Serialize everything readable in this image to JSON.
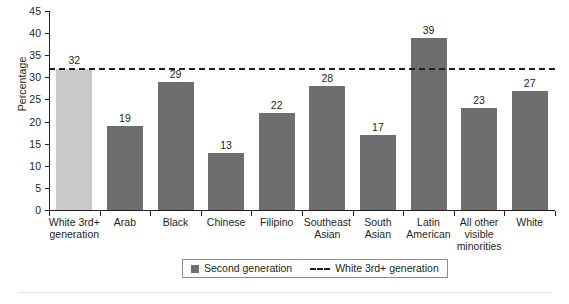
{
  "chart_data": {
    "type": "bar",
    "title": "",
    "xlabel": "",
    "ylabel": "Percentage",
    "ylim": [
      0,
      45
    ],
    "yticks": [
      0,
      5,
      10,
      15,
      20,
      25,
      30,
      35,
      40,
      45
    ],
    "grid": false,
    "legend_position": "bottom",
    "categories": [
      "White 3rd+ generation",
      "Arab",
      "Black",
      "Chinese",
      "Filipino",
      "Southeast Asian",
      "South Asian",
      "Latin American",
      "All other visible minorities",
      "White"
    ],
    "category_lines": [
      [
        "White 3rd+",
        "generation"
      ],
      [
        "Arab"
      ],
      [
        "Black"
      ],
      [
        "Chinese"
      ],
      [
        "Filipino"
      ],
      [
        "Southeast",
        "Asian"
      ],
      [
        "South",
        "Asian"
      ],
      [
        "Latin",
        "American"
      ],
      [
        "All other",
        "visible",
        "minorities"
      ],
      [
        "White"
      ]
    ],
    "series": [
      {
        "name": "Second generation",
        "values": [
          32,
          19,
          29,
          13,
          22,
          28,
          17,
          39,
          23,
          27
        ],
        "bar_styles": [
          "baseline",
          "second",
          "second",
          "second",
          "second",
          "second",
          "second",
          "second",
          "second",
          "second"
        ]
      }
    ],
    "reference_line": {
      "label": "White 3rd+ generation",
      "value": 32,
      "style": "dashed"
    },
    "legend": [
      {
        "label": "Second generation",
        "marker": "square-swatch",
        "color": "#6e6e6e"
      },
      {
        "label": "White 3rd+ generation",
        "marker": "dashed-line",
        "color": "#231f20"
      }
    ],
    "colors": {
      "second_generation_bar": "#6e6e6e",
      "baseline_bar": "#c9c9c9",
      "axis": "#231f20",
      "reference_line": "#231f20",
      "legend_border": "#8d8d8d",
      "bottom_rule": "#e3e3e6"
    }
  }
}
